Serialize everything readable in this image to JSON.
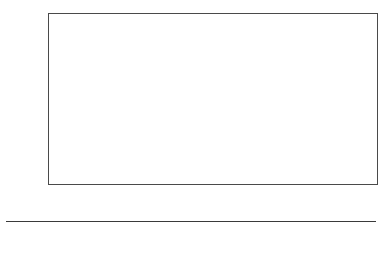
{
  "chart_data": {
    "type": "bar",
    "subtype": "stacked-bar-100",
    "title": "",
    "xlabel": "",
    "ylabel": "Percentage",
    "ylim": [
      0,
      100
    ],
    "ytick_labels": [
      "0%",
      "10%",
      "20%",
      "30%",
      "40%",
      "50%",
      "60%",
      "70%",
      "80%",
      "90%",
      "100%"
    ],
    "ytick_values": [
      0,
      10,
      20,
      30,
      40,
      50,
      60,
      70,
      80,
      90,
      100
    ],
    "grid": true,
    "legend_position": "bottom",
    "categories": [
      "Egypt",
      "Syria",
      "Sudan",
      "Lebanon",
      "Jordan",
      "Palestine",
      "Other countries"
    ],
    "series": [
      {
        "name": "Education",
        "color": "#111111",
        "values": [
          9,
          6,
          5,
          15,
          18,
          9,
          14
        ]
      },
      {
        "name": "Legal and law enforcement activities",
        "color": "#3c3c3c",
        "values": [
          7,
          18,
          8,
          5,
          3,
          4,
          0
        ]
      },
      {
        "name": "Media and journalism",
        "color": "#8e8e8e",
        "values": [
          14,
          10,
          14,
          0,
          0,
          10,
          0
        ]
      },
      {
        "name": "Finance and insurance activities",
        "color": "#4a4a4a",
        "values": [
          0,
          0,
          0,
          44,
          40,
          25,
          17
        ]
      },
      {
        "name": "Managerial and administrative services",
        "color": "#9a9a9a",
        "values": [
          0,
          0,
          0,
          17,
          27,
          0,
          15
        ]
      },
      {
        "name": "Professional, scientific and technical",
        "color": "#e2e2e0",
        "values": [
          70,
          66,
          73,
          19,
          12,
          52,
          54
        ]
      }
    ]
  },
  "axis": {
    "y_title": "Percentage"
  },
  "legend": {
    "items": [
      {
        "label": "Education",
        "color": "#111111"
      },
      {
        "label": "Legal and law enforcement activities",
        "color": "#3c3c3c"
      },
      {
        "label": "Media and journalism",
        "color": "#8e8e8e"
      },
      {
        "label": "Finance and insurance activities",
        "color": "#4a4a4a"
      },
      {
        "label": "Managerial and administrative services",
        "color": "#9a9a9a"
      },
      {
        "label": "Professional, scientific and technical",
        "color": "#e2e2e0"
      }
    ]
  }
}
